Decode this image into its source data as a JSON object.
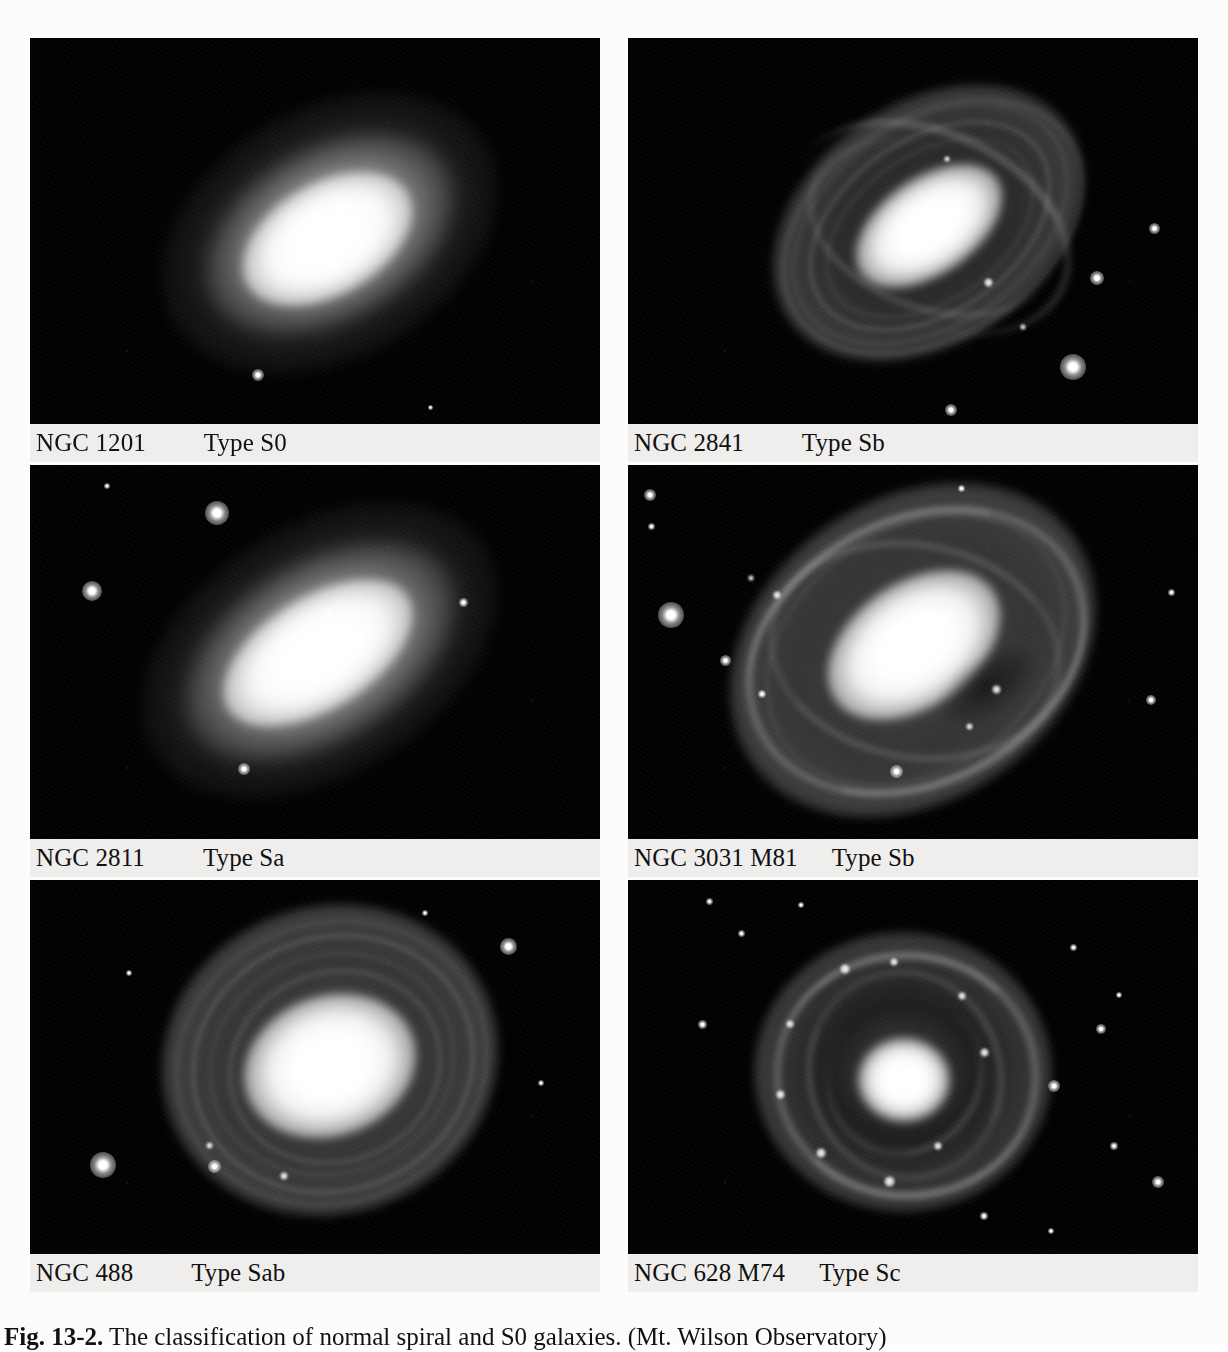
{
  "figure": {
    "caption_label": "Fig. 13-2.",
    "caption_text": "The classification of normal spiral and S0 galaxies. (Mt. Wilson Observatory)"
  },
  "panels": [
    {
      "id": "ngc-1201",
      "ngc": "NGC 1201",
      "type_label": "Type S0",
      "position": "top-left",
      "morphology": "lenticular, smooth featureless lens, no spiral arms",
      "inclination": "inclined, major axis tilted about -30 degrees",
      "field_stars": 2
    },
    {
      "id": "ngc-2841",
      "ngc": "NGC 2841",
      "type_label": "Type Sb",
      "position": "top-right",
      "morphology": "multi-armed flocculent spiral, many tightly wound filamentary arms",
      "inclination": "inclined, major axis tilted about -35 degrees",
      "field_stars": 4
    },
    {
      "id": "ngc-2811",
      "ngc": "NGC 2811",
      "type_label": "Type Sa",
      "position": "middle-left",
      "morphology": "early-type spiral, large smooth bulge with very tight faint arms",
      "inclination": "inclined, major axis tilted about -32 degrees",
      "field_stars": 5
    },
    {
      "id": "ngc-3031",
      "ngc": "NGC 3031  M81",
      "type_label": "Type Sb",
      "position": "middle-right",
      "morphology": "grand-design spiral, bright bulge with two well defined arms",
      "inclination": "inclined, major axis tilted about -35 degrees",
      "field_stars": 9
    },
    {
      "id": "ngc-488",
      "ngc": "NGC 488",
      "type_label": "Type Sab",
      "position": "bottom-left",
      "morphology": "nearly face-on, many tightly wound concentric arms around a large bulge",
      "inclination": "nearly face-on",
      "field_stars": 6
    },
    {
      "id": "ngc-628",
      "ngc": "NGC 628  M74",
      "type_label": "Type Sc",
      "position": "bottom-right",
      "morphology": "face-on late-type spiral, small nucleus with open knotty arms",
      "inclination": "face-on",
      "field_stars": 12
    }
  ]
}
